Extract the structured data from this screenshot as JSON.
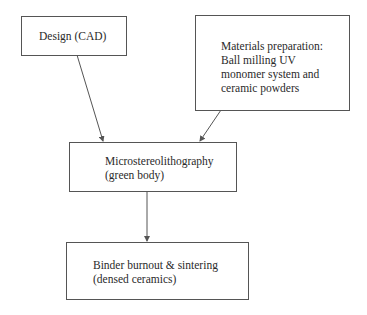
{
  "diagram": {
    "type": "flowchart",
    "nodes": [
      {
        "id": "design",
        "lines": [
          "Design (CAD)"
        ]
      },
      {
        "id": "materials",
        "lines": [
          "Materials preparation:",
          "Ball milling UV",
          "monomer system and",
          "ceramic powders"
        ]
      },
      {
        "id": "micro",
        "lines": [
          "Microstereolithography",
          "(green body)"
        ]
      },
      {
        "id": "binder",
        "lines": [
          "Binder burnout & sintering",
          "(densed ceramics)"
        ]
      }
    ],
    "edges": [
      {
        "from": "design",
        "to": "micro"
      },
      {
        "from": "materials",
        "to": "micro"
      },
      {
        "from": "micro",
        "to": "binder"
      }
    ]
  },
  "colors": {
    "stroke": "#555555",
    "text": "#2a2a2a",
    "background": "#ffffff"
  }
}
